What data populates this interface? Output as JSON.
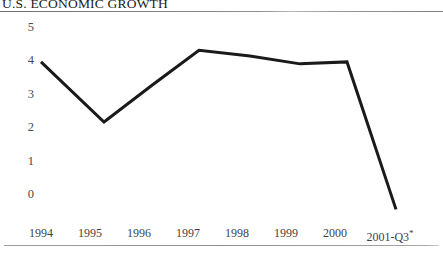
{
  "chart_data": {
    "type": "line",
    "title": "U.S. ECONOMIC GROWTH",
    "xlabel": "",
    "ylabel": "",
    "categories": [
      "1994",
      "1995",
      "1996",
      "1997",
      "1998",
      "1999",
      "2000",
      "2001-Q3*"
    ],
    "values": [
      4.1,
      2.55,
      3.5,
      4.4,
      4.25,
      4.05,
      4.1,
      0.3
    ],
    "series": [
      {
        "name": "U.S. Economic Growth",
        "values": [
          4.1,
          2.55,
          3.5,
          4.4,
          4.25,
          4.05,
          4.1,
          0.3
        ]
      }
    ],
    "ylim": [
      0,
      5
    ],
    "yticks": [
      0,
      1,
      2,
      3,
      4,
      5
    ],
    "ytick_labels": [
      "0",
      "1",
      "2",
      "3",
      "4",
      "5"
    ],
    "grid": false,
    "legend": false,
    "line_color": "#1a1a1a",
    "line_width": 3,
    "annotations": [
      "*"
    ],
    "footnote_marker": "*"
  },
  "axes": {
    "y_labels": [
      "5",
      "4",
      "3",
      "2",
      "1",
      "0"
    ],
    "x_labels": [
      "1994",
      "1995",
      "1996",
      "1997",
      "1998",
      "1999",
      "2000",
      "2001-Q3"
    ]
  },
  "colors": {
    "line": "#1a1a1a",
    "rule": "#8a8a8a",
    "tick_text": "#4a4a4a",
    "title_text": "#222222",
    "background": "#ffffff"
  }
}
